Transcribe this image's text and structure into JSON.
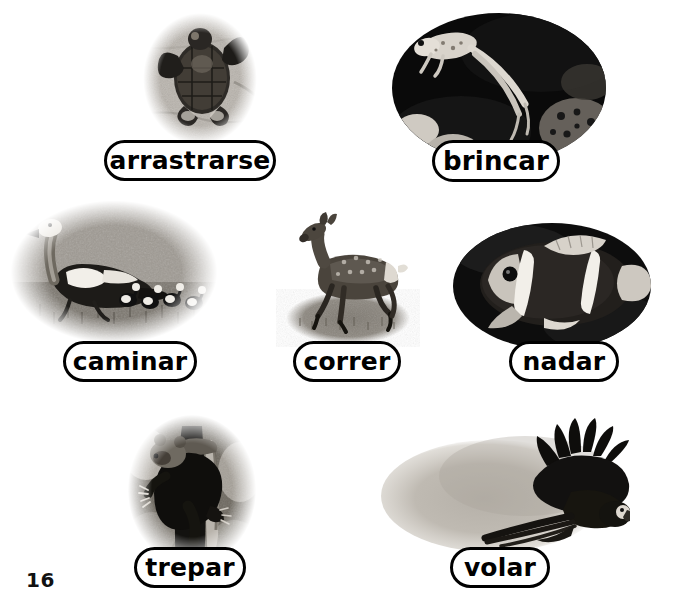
{
  "page": {
    "number": "16",
    "background_color": "#ffffff",
    "text_color": "#000000",
    "width": 683,
    "height": 607
  },
  "items": [
    {
      "id": "arrastrarse",
      "label": "arrastrarse",
      "icon_name": "sea-turtle-photo",
      "subject": "baby sea turtle crawling on sand",
      "vignette": "soft-oval-light",
      "photo": {
        "x": 118,
        "y": 6,
        "w": 164,
        "h": 146
      },
      "pill": {
        "x": 104,
        "y": 140,
        "w": 172,
        "h": 41,
        "font_size": 25
      }
    },
    {
      "id": "brincar",
      "label": "brincar",
      "icon_name": "frog-photo",
      "subject": "frog leaping over dark ground",
      "vignette": "hard-oval-dark",
      "photo": {
        "x": 391,
        "y": 12,
        "w": 217,
        "h": 152
      },
      "pill": {
        "x": 432,
        "y": 140,
        "w": 128,
        "h": 42,
        "font_size": 26
      }
    },
    {
      "id": "caminar",
      "label": "caminar",
      "icon_name": "goose-photo",
      "subject": "goose walking on grass with goslings",
      "vignette": "soft-oval-mid",
      "photo": {
        "x": 8,
        "y": 196,
        "w": 212,
        "h": 150
      },
      "pill": {
        "x": 63,
        "y": 341,
        "w": 134,
        "h": 41,
        "font_size": 25
      }
    },
    {
      "id": "correr",
      "label": "correr",
      "icon_name": "deer-photo",
      "subject": "deer running on an oval patch of grass",
      "vignette": "ground-oval",
      "photo": {
        "x": 270,
        "y": 200,
        "w": 155,
        "h": 148
      },
      "pill": {
        "x": 293,
        "y": 341,
        "w": 108,
        "h": 41,
        "font_size": 25
      }
    },
    {
      "id": "nadar",
      "label": "nadar",
      "icon_name": "clownfish-photo",
      "subject": "striped clownfish swimming",
      "vignette": "hard-oval-dark",
      "photo": {
        "x": 452,
        "y": 222,
        "w": 200,
        "h": 128
      },
      "pill": {
        "x": 509,
        "y": 341,
        "w": 110,
        "h": 41,
        "font_size": 25
      }
    },
    {
      "id": "trepar",
      "label": "trepar",
      "icon_name": "bear-photo",
      "subject": "bear climbing a tree trunk",
      "vignette": "soft-oval-dark",
      "photo": {
        "x": 122,
        "y": 414,
        "w": 140,
        "h": 152
      },
      "pill": {
        "x": 134,
        "y": 547,
        "w": 112,
        "h": 41,
        "font_size": 25
      }
    },
    {
      "id": "volar",
      "label": "volar",
      "icon_name": "macaw-photo",
      "subject": "macaw flying with wings spread",
      "vignette": "soft-blob-light",
      "photo": {
        "x": 375,
        "y": 418,
        "w": 255,
        "h": 150
      },
      "pill": {
        "x": 450,
        "y": 547,
        "w": 100,
        "h": 41,
        "font_size": 25
      }
    }
  ]
}
